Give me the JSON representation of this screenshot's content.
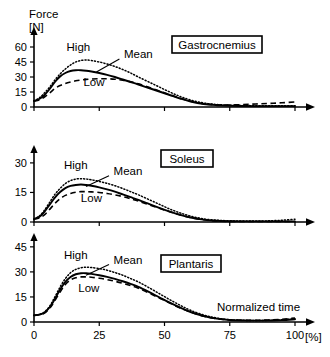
{
  "figure": {
    "y_axis_label_line1": "Force",
    "y_axis_label_line2": "[N]",
    "x_axis_label": "Normalized time",
    "x_axis_unit": "[%]"
  },
  "chart_data": {
    "type": "line",
    "title": "",
    "xlabel": "Normalized time",
    "ylabel": "Force [N]",
    "xlim": [
      0,
      100
    ],
    "x_ticks": [
      0,
      25,
      50,
      75,
      100
    ],
    "x_tick_labels": [
      "0",
      "25",
      "50",
      "75",
      "100"
    ],
    "grid": false,
    "legend_position": "inline-annotations",
    "series_names": [
      "High",
      "Mean",
      "Low"
    ],
    "panels": [
      {
        "name": "Gastrocnemius",
        "label": "Gastrocnemius",
        "ylim": [
          0,
          67
        ],
        "y_ticks": [
          0,
          15,
          30,
          45,
          60
        ],
        "y_tick_labels": [
          "0",
          "15",
          "30",
          "45",
          "60"
        ],
        "annotations": [
          {
            "text": "High",
            "x": 17,
            "y": 56
          },
          {
            "text": "Mean",
            "x": 40,
            "y": 49
          },
          {
            "text": "Low",
            "x": 23,
            "y": 21
          }
        ],
        "x": [
          0,
          2,
          4,
          6,
          8,
          10,
          12,
          14,
          16,
          18,
          20,
          22,
          25,
          28,
          31,
          34,
          37,
          40,
          44,
          48,
          52,
          56,
          60,
          65,
          70,
          75,
          80,
          85,
          90,
          95,
          100
        ],
        "series": [
          {
            "name": "High",
            "style": "dotted",
            "values": [
              6,
              9,
              14,
              20,
              27,
              33,
              38,
              42,
              45,
              46.5,
              47,
              46.5,
              45,
              43,
              40.5,
              37.5,
              34,
              30,
              25,
              20,
              15,
              10.5,
              7,
              4,
              2.5,
              1.8,
              1.5,
              1.3,
              1.2,
              1.2,
              1.2
            ]
          },
          {
            "name": "Mean",
            "style": "solid",
            "values": [
              6,
              8,
              12,
              18,
              25,
              30.5,
              34,
              36,
              36.8,
              36.8,
              36.3,
              35.5,
              34,
              32.2,
              30,
              27.5,
              25,
              22.5,
              19,
              15.5,
              12,
              8.5,
              5.5,
              3,
              1.8,
              1.2,
              1,
              0.9,
              0.9,
              0.9,
              0.9
            ]
          },
          {
            "name": "Low",
            "style": "dashed",
            "values": [
              6,
              7,
              10,
              14,
              18.5,
              21.5,
              23.5,
              25,
              26.2,
              27,
              27.6,
              28,
              28.3,
              28.2,
              27.8,
              26.8,
              25.2,
              23.2,
              19.8,
              16,
              12.3,
              8.8,
              5.8,
              3.2,
              2.2,
              2.0,
              2.4,
              3.0,
              3.6,
              4.2,
              5.0
            ]
          }
        ]
      },
      {
        "name": "Soleus",
        "label": "Soleus",
        "ylim": [
          0,
          34
        ],
        "y_ticks": [
          0,
          15,
          30
        ],
        "y_tick_labels": [
          "0",
          "15",
          "30"
        ],
        "annotations": [
          {
            "text": "High",
            "x": 16,
            "y": 27
          },
          {
            "text": "Mean",
            "x": 36,
            "y": 24
          },
          {
            "text": "Low",
            "x": 22,
            "y": 10
          }
        ],
        "x": [
          0,
          2,
          4,
          6,
          8,
          10,
          12,
          14,
          16,
          18,
          20,
          22,
          25,
          28,
          31,
          34,
          37,
          40,
          44,
          48,
          52,
          56,
          60,
          65,
          70,
          75,
          80,
          85,
          90,
          95,
          100
        ],
        "series": [
          {
            "name": "High",
            "style": "dotted",
            "values": [
              1.5,
              3,
              6,
              10,
              14,
              17,
              19.5,
              21,
              21.8,
              22,
              21.8,
              21.4,
              20.6,
              19.6,
              18.4,
              17,
              15.4,
              13.8,
              11.4,
              9,
              6.6,
              4.6,
              3,
              1.6,
              0.9,
              0.6,
              0.5,
              0.5,
              0.6,
              0.9,
              1.4
            ]
          },
          {
            "name": "Mean",
            "style": "solid",
            "values": [
              1.5,
              2.6,
              5.2,
              8.8,
              12.4,
              15.2,
              17.2,
              18.3,
              18.8,
              19,
              18.8,
              18.4,
              17.6,
              16.6,
              15.4,
              14,
              12.6,
              11.2,
              9.2,
              7.2,
              5.3,
              3.6,
              2.3,
              1.2,
              0.6,
              0.4,
              0.3,
              0.3,
              0.3,
              0.3,
              0.3
            ]
          },
          {
            "name": "Low",
            "style": "dashed",
            "values": [
              1.5,
              2,
              3.6,
              6.4,
              9.4,
              11.8,
              13.5,
              14.5,
              15.1,
              15.4,
              15.4,
              15.3,
              15,
              14.5,
              13.8,
              12.9,
              11.8,
              10.6,
              8.8,
              7,
              5.2,
              3.6,
              2.3,
              1.1,
              0.5,
              0.3,
              0.25,
              0.25,
              0.25,
              0.25,
              0.25
            ]
          }
        ]
      },
      {
        "name": "Plantaris",
        "label": "Plantaris",
        "ylim": [
          0,
          50
        ],
        "y_ticks": [
          0,
          15,
          30,
          45
        ],
        "y_tick_labels": [
          "0",
          "15",
          "30",
          "45"
        ],
        "annotations": [
          {
            "text": "High",
            "x": 16,
            "y": 38
          },
          {
            "text": "Mean",
            "x": 36,
            "y": 35
          },
          {
            "text": "Low",
            "x": 21,
            "y": 18
          }
        ],
        "x": [
          0,
          2,
          4,
          6,
          8,
          10,
          12,
          14,
          16,
          18,
          20,
          22,
          25,
          28,
          31,
          34,
          37,
          40,
          44,
          48,
          52,
          56,
          60,
          65,
          70,
          75,
          80,
          85,
          90,
          95,
          100
        ],
        "series": [
          {
            "name": "High",
            "style": "dotted",
            "values": [
              4,
              4.5,
              6,
              9.5,
              15,
              21,
              26,
              29.5,
              31.5,
              32.5,
              32.8,
              32.6,
              32,
              31,
              29.6,
              28,
              26,
              24,
              20.6,
              17,
              13.4,
              10,
              7,
              4.2,
              2.4,
              1.4,
              1,
              0.9,
              1,
              1.3,
              2
            ]
          },
          {
            "name": "Mean",
            "style": "solid",
            "values": [
              4,
              4.4,
              5.6,
              8.8,
              13.8,
              19.4,
              24,
              27,
              28.6,
              29.2,
              29.2,
              28.8,
              28,
              27,
              25.8,
              24.4,
              22.8,
              21,
              18,
              14.8,
              11.6,
              8.6,
              6,
              3.6,
              2,
              1.2,
              0.9,
              0.8,
              0.9,
              1.1,
              1.6
            ]
          },
          {
            "name": "Low",
            "style": "dashed",
            "values": [
              4,
              4.3,
              5.3,
              8.2,
              12.8,
              18,
              22.4,
              25.2,
              26.5,
              27,
              27,
              26.8,
              26.2,
              25.4,
              24.4,
              23.2,
              21.8,
              20.2,
              17.4,
              14.4,
              11.4,
              8.4,
              5.9,
              3.5,
              2,
              1.3,
              1,
              1,
              1.2,
              1.6,
              2.4
            ]
          }
        ]
      }
    ]
  }
}
